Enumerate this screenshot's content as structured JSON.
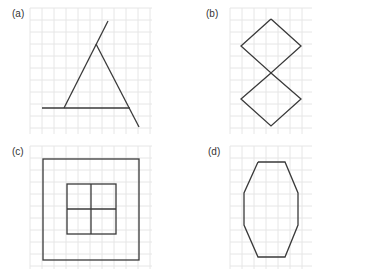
{
  "panels": [
    {
      "label": "(a)",
      "figure": "triangle-with-extended-sides",
      "grid": {
        "x0": 30,
        "y0": 8,
        "x1": 152,
        "y1": 134,
        "step": 12
      },
      "lines": [
        [
          42,
          108,
          130,
          108
        ],
        [
          64,
          108,
          108,
          21
        ],
        [
          96,
          44,
          139,
          127
        ]
      ]
    },
    {
      "label": "(b)",
      "figure": "two-diamonds-vertex-to-vertex",
      "grid": {
        "x0": 230,
        "y0": 8,
        "x1": 312,
        "y1": 134,
        "step": 12
      },
      "polylines": [
        [
          [
            271,
            19
          ],
          [
            301,
            46
          ],
          [
            271,
            73
          ],
          [
            241,
            46
          ],
          [
            271,
            19
          ]
        ],
        [
          [
            271,
            73
          ],
          [
            301,
            99
          ],
          [
            271,
            126
          ],
          [
            241,
            99
          ],
          [
            271,
            73
          ]
        ]
      ]
    },
    {
      "label": "(c)",
      "figure": "square-inside-square-divided-into-four",
      "grid": {
        "x0": 30,
        "y0": 146,
        "x1": 152,
        "y1": 269,
        "step": 12
      },
      "rects": [
        [
          43,
          159,
          96,
          101
        ],
        [
          67,
          184,
          49,
          50
        ]
      ],
      "lines": [
        [
          91,
          184,
          91,
          234
        ],
        [
          67,
          209,
          116,
          209
        ]
      ]
    },
    {
      "label": "(d)",
      "figure": "elongated-octagon",
      "grid": {
        "x0": 230,
        "y0": 146,
        "x1": 312,
        "y1": 269,
        "step": 12
      },
      "polylines": [
        [
          [
            258,
            162
          ],
          [
            285,
            162
          ],
          [
            298,
            193
          ],
          [
            298,
            225
          ],
          [
            285,
            257
          ],
          [
            258,
            257
          ],
          [
            244,
            225
          ],
          [
            244,
            193
          ],
          [
            258,
            162
          ]
        ]
      ]
    }
  ],
  "colors": {
    "stroke": "#3a3a3a",
    "grid": "#e6e6e6",
    "label": "#333333"
  }
}
